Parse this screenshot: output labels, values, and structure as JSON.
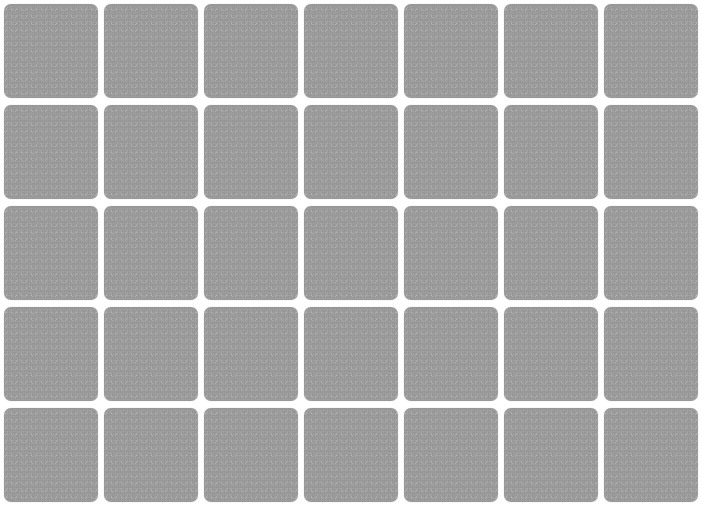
{
  "game": {
    "type": "memory-card-grid",
    "columns": 7,
    "rows": 5,
    "card_state": "face-down",
    "card_back_color": "#9b9b9b",
    "card_pattern_color": "#b8b8b8",
    "background_color": "#ffffff",
    "cards": [
      {
        "row": 1,
        "col": 1,
        "state": "face-down"
      },
      {
        "row": 1,
        "col": 2,
        "state": "face-down"
      },
      {
        "row": 1,
        "col": 3,
        "state": "face-down"
      },
      {
        "row": 1,
        "col": 4,
        "state": "face-down"
      },
      {
        "row": 1,
        "col": 5,
        "state": "face-down"
      },
      {
        "row": 1,
        "col": 6,
        "state": "face-down"
      },
      {
        "row": 1,
        "col": 7,
        "state": "face-down"
      },
      {
        "row": 2,
        "col": 1,
        "state": "face-down"
      },
      {
        "row": 2,
        "col": 2,
        "state": "face-down"
      },
      {
        "row": 2,
        "col": 3,
        "state": "face-down"
      },
      {
        "row": 2,
        "col": 4,
        "state": "face-down"
      },
      {
        "row": 2,
        "col": 5,
        "state": "face-down"
      },
      {
        "row": 2,
        "col": 6,
        "state": "face-down"
      },
      {
        "row": 2,
        "col": 7,
        "state": "face-down"
      },
      {
        "row": 3,
        "col": 1,
        "state": "face-down"
      },
      {
        "row": 3,
        "col": 2,
        "state": "face-down"
      },
      {
        "row": 3,
        "col": 3,
        "state": "face-down"
      },
      {
        "row": 3,
        "col": 4,
        "state": "face-down"
      },
      {
        "row": 3,
        "col": 5,
        "state": "face-down"
      },
      {
        "row": 3,
        "col": 6,
        "state": "face-down"
      },
      {
        "row": 3,
        "col": 7,
        "state": "face-down"
      },
      {
        "row": 4,
        "col": 1,
        "state": "face-down"
      },
      {
        "row": 4,
        "col": 2,
        "state": "face-down"
      },
      {
        "row": 4,
        "col": 3,
        "state": "face-down"
      },
      {
        "row": 4,
        "col": 4,
        "state": "face-down"
      },
      {
        "row": 4,
        "col": 5,
        "state": "face-down"
      },
      {
        "row": 4,
        "col": 6,
        "state": "face-down"
      },
      {
        "row": 4,
        "col": 7,
        "state": "face-down"
      },
      {
        "row": 5,
        "col": 1,
        "state": "face-down"
      },
      {
        "row": 5,
        "col": 2,
        "state": "face-down"
      },
      {
        "row": 5,
        "col": 3,
        "state": "face-down"
      },
      {
        "row": 5,
        "col": 4,
        "state": "face-down"
      },
      {
        "row": 5,
        "col": 5,
        "state": "face-down"
      },
      {
        "row": 5,
        "col": 6,
        "state": "face-down"
      },
      {
        "row": 5,
        "col": 7,
        "state": "face-down"
      }
    ]
  }
}
